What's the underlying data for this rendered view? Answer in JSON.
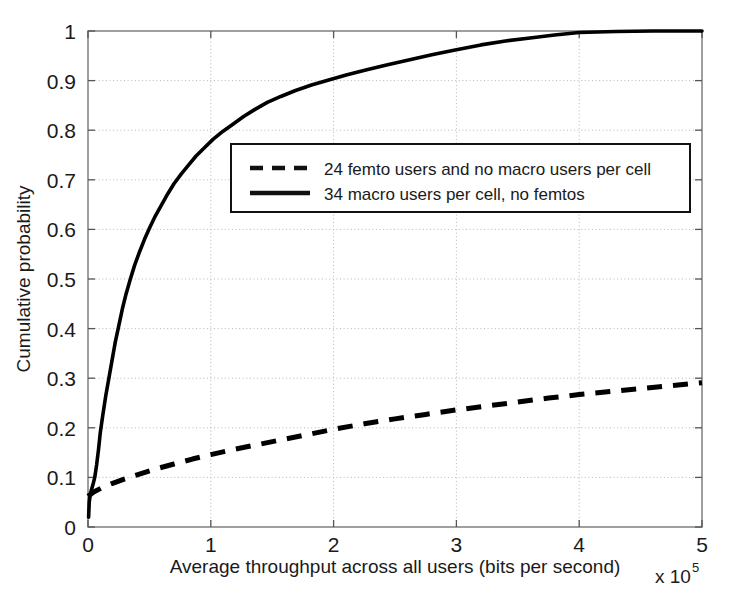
{
  "chart_data": {
    "type": "line",
    "title": "",
    "xlabel": "Average throughput across all users (bits per second)",
    "ylabel": "Cumulative probability",
    "x_exponent_base": "x 10",
    "x_exponent_power": "5",
    "xlim": [
      0,
      5
    ],
    "ylim": [
      0,
      1
    ],
    "grid": true,
    "legend_position": "center-top-right",
    "xticks": [
      "0",
      "1",
      "2",
      "3",
      "4",
      "5"
    ],
    "xtick_values": [
      0,
      1,
      2,
      3,
      4,
      5
    ],
    "yticks": [
      "0",
      "0.1",
      "0.2",
      "0.3",
      "0.4",
      "0.5",
      "0.6",
      "0.7",
      "0.8",
      "0.9",
      "1"
    ],
    "ytick_values": [
      0,
      0.1,
      0.2,
      0.3,
      0.4,
      0.5,
      0.6,
      0.7,
      0.8,
      0.9,
      1
    ],
    "series": [
      {
        "name": "24 femto users and no macro users per cell",
        "style": "dashed",
        "color": "#000000",
        "x": [
          0.0,
          0.05,
          0.12,
          0.2,
          0.3,
          0.4,
          0.55,
          0.7,
          0.85,
          1.0,
          1.2,
          1.4,
          1.6,
          1.8,
          2.0,
          2.25,
          2.5,
          2.75,
          3.0,
          3.25,
          3.5,
          3.75,
          4.0,
          4.25,
          4.5,
          4.75,
          5.0
        ],
        "y": [
          0.062,
          0.071,
          0.08,
          0.088,
          0.097,
          0.105,
          0.117,
          0.127,
          0.137,
          0.146,
          0.157,
          0.167,
          0.177,
          0.187,
          0.197,
          0.208,
          0.218,
          0.227,
          0.236,
          0.244,
          0.252,
          0.26,
          0.267,
          0.273,
          0.279,
          0.285,
          0.291
        ]
      },
      {
        "name": "34 macro users per cell, no femtos",
        "style": "solid",
        "color": "#000000",
        "x": [
          0.005,
          0.01,
          0.018,
          0.028,
          0.04,
          0.055,
          0.07,
          0.085,
          0.1,
          0.12,
          0.145,
          0.17,
          0.195,
          0.22,
          0.25,
          0.28,
          0.31,
          0.345,
          0.38,
          0.42,
          0.46,
          0.505,
          0.55,
          0.6,
          0.65,
          0.7,
          0.76,
          0.82,
          0.88,
          0.95,
          1.02,
          1.1,
          1.18,
          1.27,
          1.36,
          1.46,
          1.57,
          1.69,
          1.82,
          1.96,
          2.11,
          2.27,
          2.44,
          2.62,
          2.8,
          3.0,
          3.2,
          3.4,
          3.6,
          3.8,
          4.0,
          4.3,
          4.6,
          5.0
        ],
        "y": [
          0.02,
          0.05,
          0.065,
          0.075,
          0.085,
          0.1,
          0.125,
          0.155,
          0.19,
          0.225,
          0.265,
          0.3,
          0.335,
          0.37,
          0.405,
          0.44,
          0.47,
          0.5,
          0.528,
          0.555,
          0.58,
          0.605,
          0.628,
          0.65,
          0.672,
          0.692,
          0.712,
          0.73,
          0.748,
          0.765,
          0.782,
          0.798,
          0.812,
          0.828,
          0.842,
          0.856,
          0.868,
          0.88,
          0.891,
          0.901,
          0.912,
          0.922,
          0.932,
          0.942,
          0.952,
          0.962,
          0.972,
          0.98,
          0.986,
          0.992,
          0.997,
          0.999,
          1.0,
          1.0
        ]
      }
    ]
  },
  "legend": {
    "entries": [
      {
        "label": "24 femto users and no macro users per cell",
        "style": "dashed"
      },
      {
        "label": "34 macro users per cell, no femtos",
        "style": "solid"
      }
    ]
  },
  "colors": {
    "axis": "#6b6b6b",
    "grid": "#b5b5b5",
    "curve": "#111111",
    "background": "#ffffff"
  }
}
